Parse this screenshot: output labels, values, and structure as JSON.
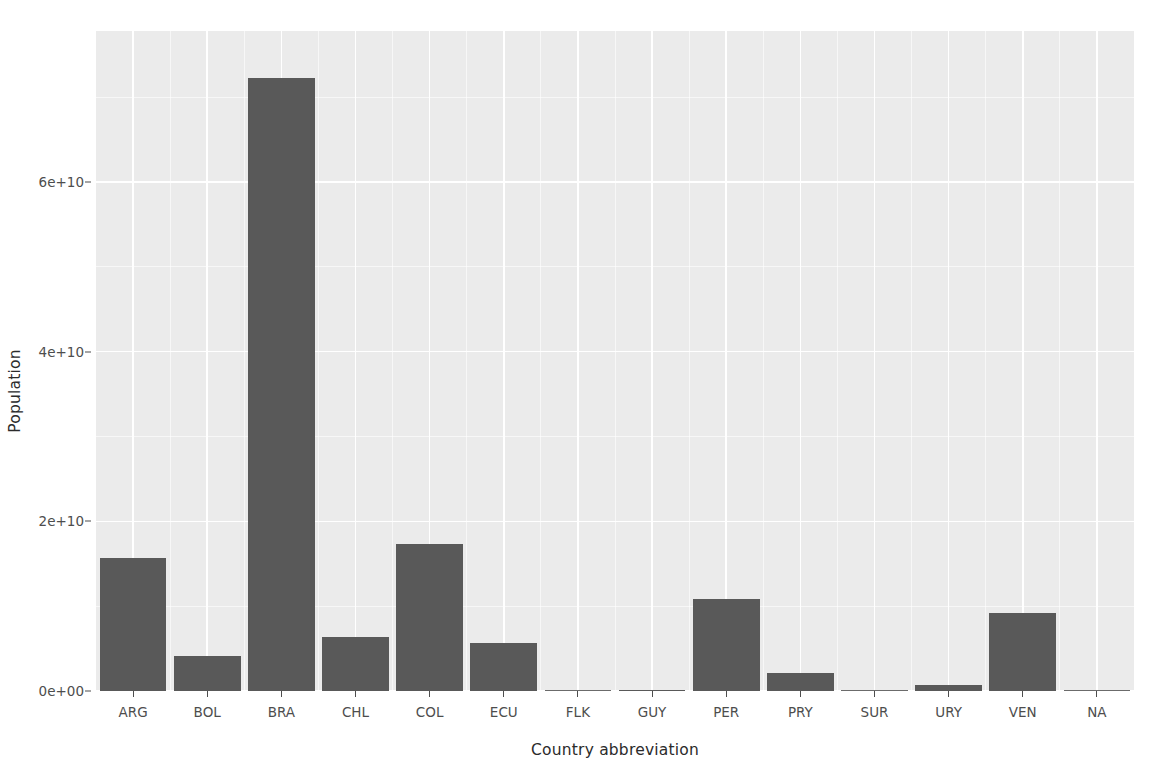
{
  "chart_data": {
    "type": "bar",
    "title": "",
    "xlabel": "Country abbreviation",
    "ylabel": "Population",
    "categories": [
      "ARG",
      "BOL",
      "BRA",
      "CHL",
      "COL",
      "ECU",
      "FLK",
      "GUY",
      "PER",
      "PRY",
      "SUR",
      "URY",
      "VEN",
      "NA"
    ],
    "values": [
      15700000000,
      4100000000,
      72300000000,
      6400000000,
      17300000000,
      5700000000,
      0,
      150000000,
      10800000000,
      2100000000,
      100000000,
      750000000,
      9200000000,
      0
    ],
    "value_labels": [
      "1.57e+10",
      "4.1e+09",
      "7.23e+10",
      "6.4e+09",
      "1.73e+10",
      "5.7e+09",
      "0",
      "1.5e+08",
      "1.08e+10",
      "2.1e+09",
      "1e+08",
      "7.5e+08",
      "9.2e+09",
      "0"
    ],
    "ylim": [
      0,
      77800000000
    ],
    "y_ticks": [
      0,
      20000000000,
      40000000000,
      60000000000
    ],
    "y_tick_labels": [
      "0e+00",
      "2e+10",
      "4e+10",
      "6e+10"
    ],
    "y_minor_ticks": [
      10000000000,
      30000000000,
      50000000000,
      70000000000
    ],
    "grid": true,
    "legend": "none",
    "bar_color": "#595959",
    "panel_color": "#ebebeb",
    "grid_color": "#ffffff",
    "axis_text_color": "#4d4d4d",
    "axis_title_color": "#2b2b2b"
  },
  "axes": {
    "y_title": "Population",
    "x_title": "Country abbreviation"
  }
}
